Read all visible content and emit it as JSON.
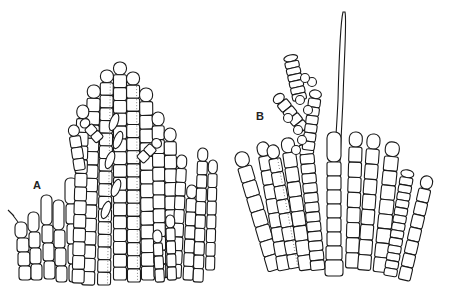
{
  "figure": {
    "panels": [
      {
        "id": "A",
        "label": "A",
        "description": "dense branched filamentous thallus with erect filaments, some with dotted cell contents"
      },
      {
        "id": "B",
        "label": "B",
        "description": "fan of erect filaments with a long terminal hair and a branched apical cluster"
      }
    ],
    "colors": {
      "line": "#1a1a1a",
      "background": "#ffffff"
    }
  }
}
